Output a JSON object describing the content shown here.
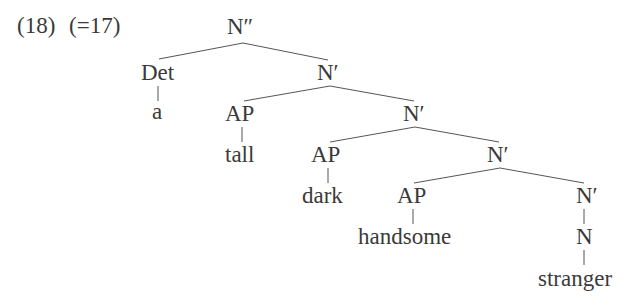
{
  "example": {
    "number": "(18)",
    "reference": "(=17)"
  },
  "tree": {
    "root": "N″",
    "nodes": {
      "n2": "N″",
      "det": "Det",
      "a": "a",
      "n1_a": "N′",
      "ap_1": "AP",
      "tall": "tall",
      "n1_b": "N′",
      "ap_2": "AP",
      "dark": "dark",
      "n1_c": "N′",
      "ap_3": "AP",
      "handsome": "handsome",
      "n1_d": "N′",
      "n": "N",
      "stranger": "stranger"
    },
    "structure": [
      {
        "parent": "N″",
        "children": [
          "Det",
          "N′"
        ]
      },
      {
        "parent": "Det",
        "children": [
          "a"
        ]
      },
      {
        "parent": "N′",
        "children": [
          "AP",
          "N′"
        ]
      },
      {
        "parent": "AP",
        "children": [
          "tall"
        ]
      },
      {
        "parent": "N′",
        "children": [
          "AP",
          "N′"
        ]
      },
      {
        "parent": "AP",
        "children": [
          "dark"
        ]
      },
      {
        "parent": "N′",
        "children": [
          "AP",
          "N′"
        ]
      },
      {
        "parent": "AP",
        "children": [
          "handsome"
        ]
      },
      {
        "parent": "N′",
        "children": [
          "N"
        ]
      },
      {
        "parent": "N",
        "children": [
          "stranger"
        ]
      }
    ]
  }
}
